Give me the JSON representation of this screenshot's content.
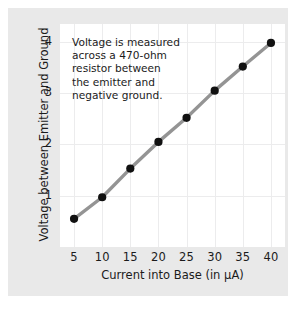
{
  "chart_data": {
    "type": "line",
    "title": "",
    "xlabel": "Current into Base (in µA)",
    "ylabel": "Voltage between Emitter and Ground",
    "x": [
      5,
      10,
      15,
      20,
      25,
      30,
      35,
      40
    ],
    "values": [
      0.55,
      0.97,
      1.53,
      2.05,
      2.52,
      3.05,
      3.52,
      3.98
    ],
    "xticks": [
      "5",
      "10",
      "15",
      "20",
      "25",
      "30",
      "35",
      "40"
    ],
    "yticks": [
      "1",
      "2",
      "3",
      "4"
    ],
    "xlim": [
      2.5,
      42.5
    ],
    "ylim": [
      0,
      4.35
    ],
    "grid": true,
    "legend": "none",
    "series": [
      {
        "name": "Emitter voltage",
        "values": [
          0.55,
          0.97,
          1.53,
          2.05,
          2.52,
          3.05,
          3.52,
          3.98
        ]
      }
    ],
    "annotations": [
      "Voltage is measured",
      "across a 470-ohm",
      "resistor between",
      "the emitter and",
      "negative ground."
    ],
    "colors": {
      "line": "#949494",
      "marker": "#111111",
      "grid": "#ececed",
      "plot_background": "#ffffff",
      "card_background": "#e9e9e9",
      "text": "#1b1b1b"
    }
  }
}
